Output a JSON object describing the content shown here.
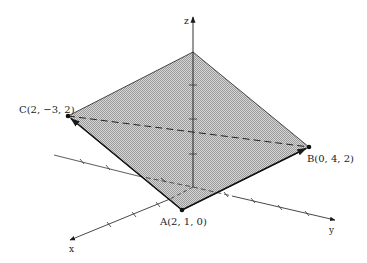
{
  "diagram": {
    "type": "3d-coordinate-plane",
    "axes": {
      "x_label": "x",
      "y_label": "y",
      "z_label": "z"
    },
    "points": {
      "A": {
        "label": "A(2, 1, 0)",
        "coords": [
          2,
          1,
          0
        ]
      },
      "B": {
        "label": "B(0, 4, 2)",
        "coords": [
          0,
          4,
          2
        ]
      },
      "C": {
        "label": "C(2, −3, 2)",
        "coords": [
          2,
          -3,
          2
        ]
      }
    },
    "vectors": [
      "A→B",
      "A→C"
    ],
    "dashed_segments": [
      "C–B"
    ],
    "plane_fill": "#c6c6c6",
    "line_color": "#1a1a1a"
  }
}
